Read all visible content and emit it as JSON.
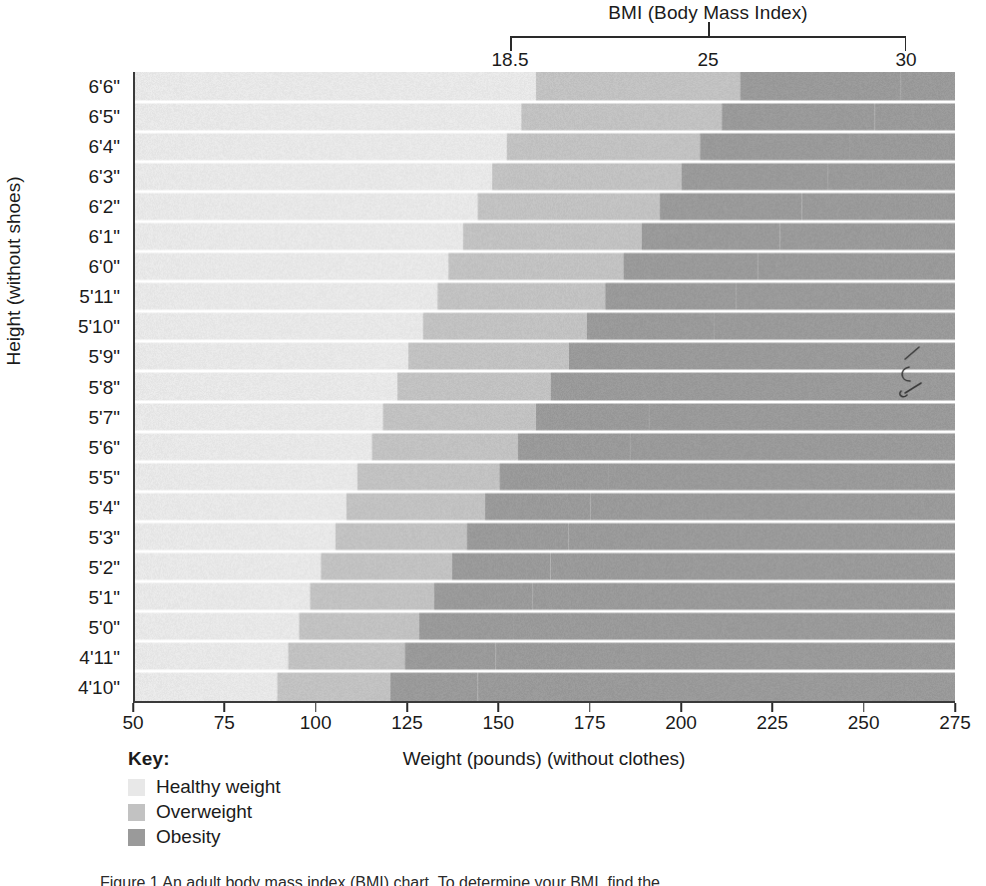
{
  "bmi_axis": {
    "title": "BMI (Body Mass Index)",
    "ticks": [
      "18.5",
      "25",
      "30"
    ]
  },
  "y_axis": {
    "title": "Height (without shoes)",
    "labels": [
      "6'6\"",
      "6'5\"",
      "6'4\"",
      "6'3\"",
      "6'2\"",
      "6'1\"",
      "6'0\"",
      "5'11\"",
      "5'10\"",
      "5'9\"",
      "5'8\"",
      "5'7\"",
      "5'6\"",
      "5'5\"",
      "5'4\"",
      "5'3\"",
      "5'2\"",
      "5'1\"",
      "5'0\"",
      "4'11\"",
      "4'10\""
    ]
  },
  "x_axis": {
    "title": "Weight (pounds) (without clothes)",
    "labels": [
      "50",
      "75",
      "100",
      "125",
      "150",
      "175",
      "200",
      "225",
      "250",
      "275"
    ]
  },
  "key": {
    "title": "Key:",
    "items": [
      {
        "label": "Healthy weight",
        "color": "#e8e8e8"
      },
      {
        "label": "Overweight",
        "color": "#c2c2c2"
      },
      {
        "label": "Obesity",
        "color": "#9a9a9a"
      }
    ]
  },
  "caption": "Figure 1 An adult body mass index (BMI) chart. To determine your BMI, find the",
  "chart_data": {
    "type": "heatmap",
    "title": "BMI (Body Mass Index)",
    "xlabel": "Weight (pounds) (without clothes)",
    "ylabel": "Height (without shoes)",
    "xlim": [
      50,
      275
    ],
    "x_ticks": [
      50,
      75,
      100,
      125,
      150,
      175,
      200,
      225,
      250,
      275
    ],
    "grid": true,
    "legend_position": "bottom-left",
    "bmi_thresholds": [
      18.5,
      25,
      30
    ],
    "band_colors": [
      "#e8e8e8",
      "#c2c2c2",
      "#9a9a9a"
    ],
    "band_names": [
      "Healthy weight",
      "Overweight",
      "Obesity"
    ],
    "rows": [
      {
        "height": "6'6\"",
        "inches": 78,
        "bmi_18_5_lb": 160,
        "bmi_25_lb": 216,
        "bmi_30_lb": 260
      },
      {
        "height": "6'5\"",
        "inches": 77,
        "bmi_18_5_lb": 156,
        "bmi_25_lb": 211,
        "bmi_30_lb": 253
      },
      {
        "height": "6'4\"",
        "inches": 76,
        "bmi_18_5_lb": 152,
        "bmi_25_lb": 205,
        "bmi_30_lb": 246
      },
      {
        "height": "6'3\"",
        "inches": 75,
        "bmi_18_5_lb": 148,
        "bmi_25_lb": 200,
        "bmi_30_lb": 240
      },
      {
        "height": "6'2\"",
        "inches": 74,
        "bmi_18_5_lb": 144,
        "bmi_25_lb": 194,
        "bmi_30_lb": 233
      },
      {
        "height": "6'1\"",
        "inches": 73,
        "bmi_18_5_lb": 140,
        "bmi_25_lb": 189,
        "bmi_30_lb": 227
      },
      {
        "height": "6'0\"",
        "inches": 72,
        "bmi_18_5_lb": 136,
        "bmi_25_lb": 184,
        "bmi_30_lb": 221
      },
      {
        "height": "5'11\"",
        "inches": 71,
        "bmi_18_5_lb": 133,
        "bmi_25_lb": 179,
        "bmi_30_lb": 215
      },
      {
        "height": "5'10\"",
        "inches": 70,
        "bmi_18_5_lb": 129,
        "bmi_25_lb": 174,
        "bmi_30_lb": 209
      },
      {
        "height": "5'9\"",
        "inches": 69,
        "bmi_18_5_lb": 125,
        "bmi_25_lb": 169,
        "bmi_30_lb": 203
      },
      {
        "height": "5'8\"",
        "inches": 68,
        "bmi_18_5_lb": 122,
        "bmi_25_lb": 164,
        "bmi_30_lb": 197
      },
      {
        "height": "5'7\"",
        "inches": 67,
        "bmi_18_5_lb": 118,
        "bmi_25_lb": 160,
        "bmi_30_lb": 191
      },
      {
        "height": "5'6\"",
        "inches": 66,
        "bmi_18_5_lb": 115,
        "bmi_25_lb": 155,
        "bmi_30_lb": 186
      },
      {
        "height": "5'5\"",
        "inches": 65,
        "bmi_18_5_lb": 111,
        "bmi_25_lb": 150,
        "bmi_30_lb": 180
      },
      {
        "height": "5'4\"",
        "inches": 64,
        "bmi_18_5_lb": 108,
        "bmi_25_lb": 146,
        "bmi_30_lb": 175
      },
      {
        "height": "5'3\"",
        "inches": 63,
        "bmi_18_5_lb": 105,
        "bmi_25_lb": 141,
        "bmi_30_lb": 169
      },
      {
        "height": "5'2\"",
        "inches": 62,
        "bmi_18_5_lb": 101,
        "bmi_25_lb": 137,
        "bmi_30_lb": 164
      },
      {
        "height": "5'1\"",
        "inches": 61,
        "bmi_18_5_lb": 98,
        "bmi_25_lb": 132,
        "bmi_30_lb": 159
      },
      {
        "height": "5'0\"",
        "inches": 60,
        "bmi_18_5_lb": 95,
        "bmi_25_lb": 128,
        "bmi_30_lb": 154
      },
      {
        "height": "4'11\"",
        "inches": 59,
        "bmi_18_5_lb": 92,
        "bmi_25_lb": 124,
        "bmi_30_lb": 149
      },
      {
        "height": "4'10\"",
        "inches": 58,
        "bmi_18_5_lb": 89,
        "bmi_25_lb": 120,
        "bmi_30_lb": 144
      }
    ]
  }
}
